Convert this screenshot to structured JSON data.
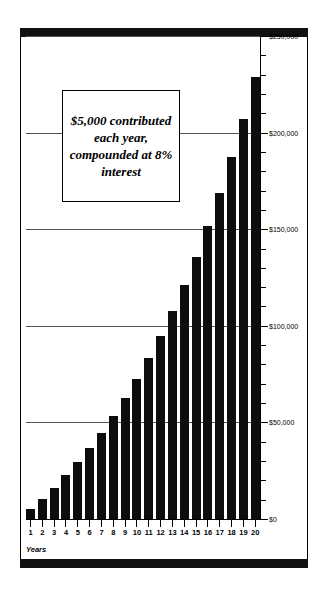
{
  "chart_data": {
    "type": "bar",
    "title": "",
    "subtitle": "",
    "xlabel": "Years",
    "ylabel": "",
    "categories": [
      "1",
      "2",
      "3",
      "4",
      "5",
      "6",
      "7",
      "8",
      "9",
      "10",
      "11",
      "12",
      "13",
      "14",
      "15",
      "16",
      "17",
      "18",
      "19",
      "20"
    ],
    "values": [
      5000,
      10400,
      16232,
      22531,
      29333,
      36680,
      44614,
      53183,
      62440,
      72433,
      83227,
      94885,
      107476,
      121074,
      135760,
      151620,
      168752,
      187253,
      207243,
      228810
    ],
    "series": [
      {
        "name": "Account balance",
        "values": [
          5000,
          10400,
          16232,
          22531,
          29333,
          36680,
          44614,
          53183,
          62440,
          72433,
          83227,
          94885,
          107476,
          121074,
          135760,
          151620,
          168752,
          187253,
          207243,
          228810
        ]
      }
    ],
    "ylim": [
      0,
      250000
    ],
    "ytick_labels": [
      "$0",
      "$50,000",
      "$100,000",
      "$150,000",
      "$200,000",
      "$250,000"
    ],
    "ytick_values": [
      0,
      50000,
      100000,
      150000,
      200000,
      250000
    ],
    "ytick_minor_step": 10000,
    "gridlines": [
      50000,
      100000,
      150000,
      200000,
      250000
    ],
    "grid": true,
    "legend": "none",
    "bar_color": "#0d0d0d",
    "annotation": "$5,000 contributed each year, compounded at 8% interest"
  },
  "axis": {
    "x_title": "Years"
  }
}
